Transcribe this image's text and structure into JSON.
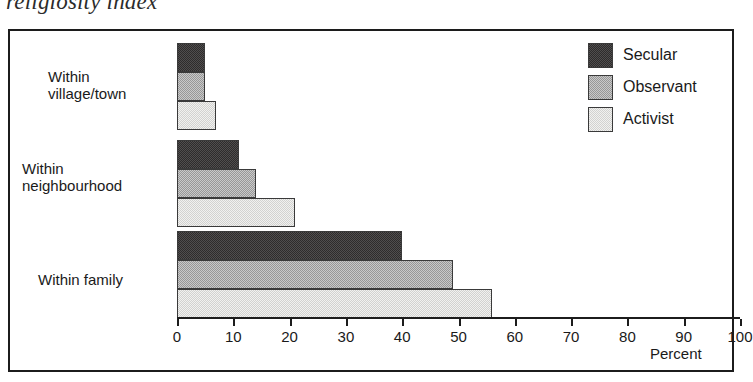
{
  "chart_data": {
    "type": "bar",
    "orientation": "horizontal",
    "title": "religiosity index",
    "xlabel": "Percent",
    "ylabel": "",
    "xlim": [
      0,
      100
    ],
    "xticks": [
      0,
      10,
      20,
      30,
      40,
      50,
      60,
      70,
      80,
      90,
      100
    ],
    "grid": false,
    "legend_position": "top-right",
    "categories": [
      "Within village/town",
      "Within neighbourhood",
      "Within family"
    ],
    "series": [
      {
        "name": "Secular",
        "color": "#2e2c2c",
        "values": [
          5,
          11,
          40
        ]
      },
      {
        "name": "Observant",
        "color": "#c9c9c9",
        "values": [
          5,
          14,
          49
        ]
      },
      {
        "name": "Activist",
        "color": "#f1f1ef",
        "values": [
          7,
          21,
          56
        ]
      }
    ]
  },
  "axis": {
    "tick_labels": [
      "0",
      "10",
      "20",
      "30",
      "40",
      "50",
      "60",
      "70",
      "80",
      "90",
      "100"
    ],
    "axis_title": "Percent"
  },
  "legend": {
    "items": [
      {
        "label": "Secular"
      },
      {
        "label": "Observant"
      },
      {
        "label": "Activist"
      }
    ]
  },
  "categories": [
    {
      "label": "Within\nvillage/town"
    },
    {
      "label": "Within\nneighbourhood"
    },
    {
      "label": "Within family"
    }
  ],
  "title": {
    "text": "religiosity index"
  }
}
